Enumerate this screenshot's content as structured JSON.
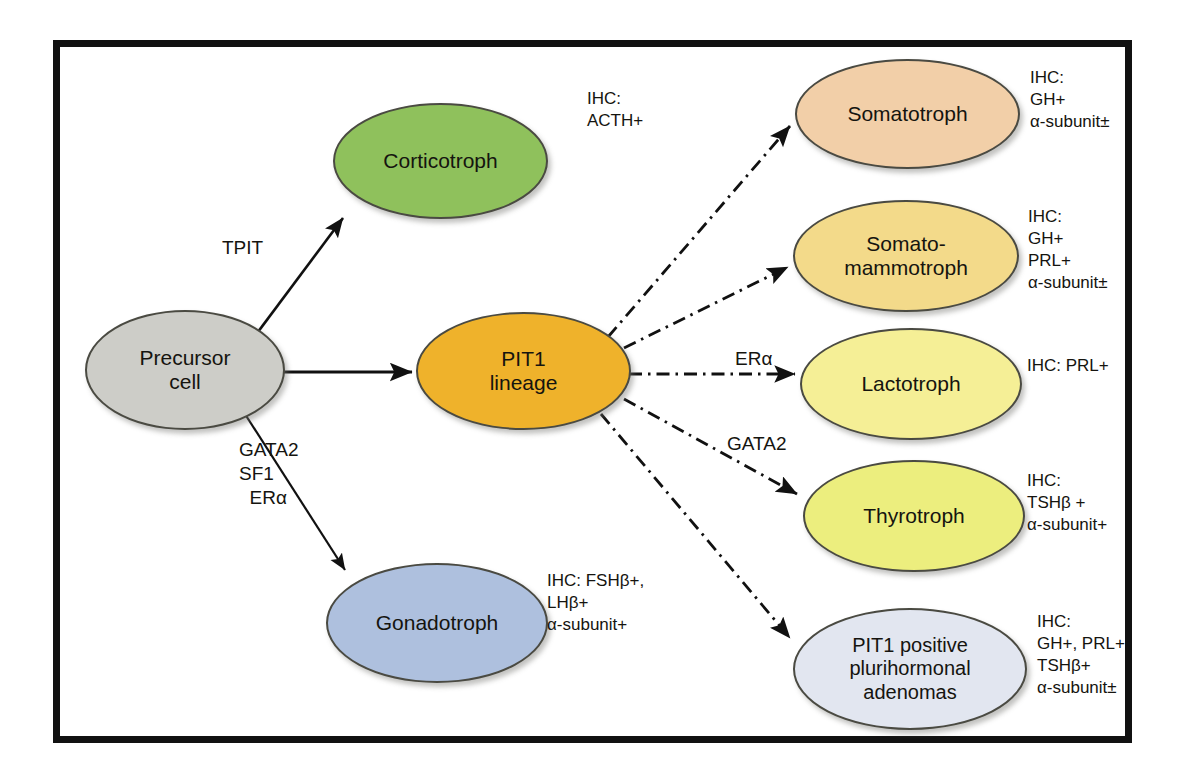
{
  "figure": {
    "frame_color": "#111111",
    "background": "#ffffff"
  },
  "nodes": [
    {
      "id": "precursor-cell",
      "label": "Precursor\ncell",
      "fill": "#cdcdc8",
      "x": 85,
      "y": 310,
      "w": 200,
      "h": 120,
      "font_size": 21
    },
    {
      "id": "corticotroph",
      "label": "Corticotroph",
      "fill": "#8fc15c",
      "x": 333,
      "y": 103,
      "w": 215,
      "h": 116,
      "font_size": 21
    },
    {
      "id": "pit1-lineage",
      "label": "PIT1\nlineage",
      "fill": "#efb22b",
      "x": 416,
      "y": 312,
      "w": 215,
      "h": 118,
      "font_size": 21
    },
    {
      "id": "gonadotroph",
      "label": "Gonadotroph",
      "fill": "#aec0de",
      "x": 326,
      "y": 563,
      "w": 222,
      "h": 120,
      "font_size": 21
    },
    {
      "id": "somatotroph",
      "label": "Somatotroph",
      "fill": "#f2cfa8",
      "x": 795,
      "y": 59,
      "w": 225,
      "h": 110,
      "font_size": 21
    },
    {
      "id": "somato-mammotroph",
      "label": "Somato-\nmammotroph",
      "fill": "#f3da8a",
      "x": 793,
      "y": 200,
      "w": 226,
      "h": 112,
      "font_size": 21
    },
    {
      "id": "lactotroph",
      "label": "Lactotroph",
      "fill": "#f5ef96",
      "x": 800,
      "y": 328,
      "w": 222,
      "h": 112,
      "font_size": 21
    },
    {
      "id": "thyrotroph",
      "label": "Thyrotroph",
      "fill": "#ecee7e",
      "x": 803,
      "y": 460,
      "w": 222,
      "h": 112,
      "font_size": 21
    },
    {
      "id": "pit1-positive-plurihormonal-adenomas",
      "label": "PIT1 positive\nplurihormonal\nadenomas",
      "fill": "#e2e6f0",
      "x": 793,
      "y": 608,
      "w": 234,
      "h": 122,
      "font_size": 20
    }
  ],
  "edge_labels": [
    {
      "id": "tpit",
      "text": "TPIT",
      "x": 222,
      "y": 236,
      "font_size": 19
    },
    {
      "id": "gata2-sf1-era",
      "text": "GATA2\nSF1\n  ERα",
      "x": 239,
      "y": 438,
      "font_size": 19
    },
    {
      "id": "era",
      "text": "ERα",
      "x": 735,
      "y": 347,
      "font_size": 19
    },
    {
      "id": "gata2",
      "text": "GATA2",
      "x": 727,
      "y": 432,
      "font_size": 19
    }
  ],
  "ihc_annotations": [
    {
      "id": "ihc-corticotroph",
      "text": "IHC:\nACTH+",
      "x": 587,
      "y": 88,
      "font_size": 17
    },
    {
      "id": "ihc-somatotroph",
      "text": "IHC:\nGH+\nα-subunit±",
      "x": 1030,
      "y": 67,
      "font_size": 17
    },
    {
      "id": "ihc-somato-mammotroph",
      "text": "IHC:\nGH+\nPRL+\nα-subunit±",
      "x": 1028,
      "y": 206,
      "font_size": 17
    },
    {
      "id": "ihc-lactotroph",
      "text": "IHC: PRL+",
      "x": 1027,
      "y": 355,
      "font_size": 17
    },
    {
      "id": "ihc-thyrotroph",
      "text": "IHC:\nTSHβ +\nα-subunit+",
      "x": 1027,
      "y": 470,
      "font_size": 17
    },
    {
      "id": "ihc-gonadotroph",
      "text": "IHC: FSHβ+,\nLHβ+\nα-subunit+",
      "x": 547,
      "y": 570,
      "font_size": 17
    },
    {
      "id": "ihc-pit1-plurihormonal",
      "text": "IHC:\nGH+, PRL+,\nTSHβ+\nα-subunit±",
      "x": 1037,
      "y": 611,
      "font_size": 17
    }
  ],
  "edges": [
    {
      "id": "precursor-to-corticotroph",
      "style": "solid",
      "from": "precursor-cell",
      "to": "corticotroph"
    },
    {
      "id": "precursor-to-pit1",
      "style": "solid",
      "from": "precursor-cell",
      "to": "pit1-lineage"
    },
    {
      "id": "precursor-to-gonadotroph",
      "style": "solid",
      "from": "precursor-cell",
      "to": "gonadotroph"
    },
    {
      "id": "pit1-to-somatotroph",
      "style": "dash-dot",
      "from": "pit1-lineage",
      "to": "somatotroph"
    },
    {
      "id": "pit1-to-somato-mammotroph",
      "style": "dash-dot",
      "from": "pit1-lineage",
      "to": "somato-mammotroph"
    },
    {
      "id": "pit1-to-lactotroph",
      "style": "dash-dot",
      "from": "pit1-lineage",
      "to": "lactotroph"
    },
    {
      "id": "pit1-to-thyrotroph",
      "style": "dash-dot",
      "from": "pit1-lineage",
      "to": "thyrotroph"
    },
    {
      "id": "pit1-to-plurihormonal",
      "style": "dash-dot",
      "from": "pit1-lineage",
      "to": "pit1-positive-plurihormonal-adenomas"
    }
  ]
}
